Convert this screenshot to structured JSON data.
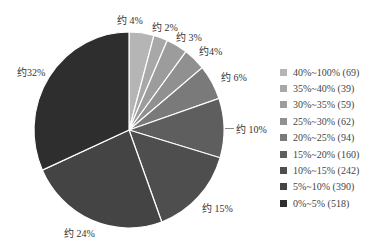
{
  "chart_data": {
    "type": "pie",
    "title": "",
    "categories": [
      "40%~100%",
      "35%~40%",
      "30%~35%",
      "25%~30%",
      "20%~25%",
      "15%~20%",
      "10%~15%",
      "5%~10%",
      "0%~5%"
    ],
    "values": [
      69,
      39,
      59,
      62,
      94,
      160,
      242,
      390,
      518
    ],
    "slice_labels": [
      "约 4%",
      "约 2%",
      "约 3%",
      "约4%",
      "约 6%",
      "约 10%",
      "约 15%",
      "约 24%",
      "约32%"
    ],
    "legend_position": "right",
    "legend": [
      {
        "label": "40%~100% (69)",
        "color": "#b5b5b5"
      },
      {
        "label": "35%~40% (39)",
        "color": "#a8a8a8"
      },
      {
        "label": "30%~35% (59)",
        "color": "#9c9c9c"
      },
      {
        "label": "25%~30% (62)",
        "color": "#909090"
      },
      {
        "label": "20%~25% (94)",
        "color": "#7a7a7a"
      },
      {
        "label": "15%~20% (160)",
        "color": "#5e5e5e"
      },
      {
        "label": "10%~15% (242)",
        "color": "#4e4e4e"
      },
      {
        "label": "5%~10% (390)",
        "color": "#444444"
      },
      {
        "label": "0%~5% (518)",
        "color": "#2e2e2e"
      }
    ]
  },
  "labels": {
    "l0": "约 4%",
    "l1": "约 2%",
    "l2": "约 3%",
    "l3": "约4%",
    "l4": "约 6%",
    "l5": "约 10%",
    "l6": "约 15%",
    "l7": "约 24%",
    "l8": "约32%"
  }
}
